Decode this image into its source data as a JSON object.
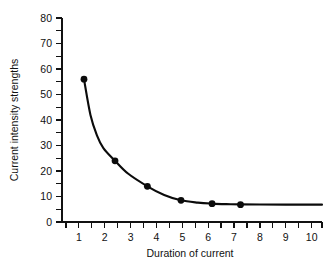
{
  "chart_data": {
    "type": "line",
    "title": "",
    "xlabel": "Duration of current",
    "ylabel": "Current intensity strengths",
    "xlim": [
      0.35,
      10.4
    ],
    "ylim": [
      0,
      80
    ],
    "grid": false,
    "legend": "none",
    "x_ticks": [
      1,
      2,
      3,
      4,
      5,
      6,
      7,
      8,
      9,
      10
    ],
    "x_tick_labels": [
      "1",
      "2",
      "3",
      "4",
      "5",
      "6",
      "7",
      "8",
      "9",
      "10"
    ],
    "x_minor_ticks": [
      0.5,
      1.5,
      2.5,
      3.5,
      4.5,
      5.5,
      6.5,
      7.5,
      8.5,
      9.5,
      10.4
    ],
    "y_ticks": [
      0,
      10,
      20,
      30,
      40,
      50,
      60,
      70,
      80
    ],
    "y_tick_labels": [
      "0",
      "10",
      "20",
      "30",
      "40",
      "50",
      "60",
      "70",
      "80"
    ],
    "y_minor_ticks": [
      5,
      15,
      25,
      35,
      45,
      55,
      65,
      75
    ],
    "series": [
      {
        "name": "Current intensity strengths",
        "marker": "filled-circle",
        "x": [
          1.2,
          2.4,
          3.65,
          4.95,
          6.15,
          7.25
        ],
        "values": [
          56,
          24,
          14,
          8.5,
          7.2,
          6.8
        ]
      }
    ],
    "curve_points": [
      [
        1.2,
        56
      ],
      [
        1.45,
        42
      ],
      [
        1.7,
        34
      ],
      [
        1.95,
        29
      ],
      [
        2.4,
        24
      ],
      [
        2.9,
        19
      ],
      [
        3.65,
        14
      ],
      [
        4.3,
        10.6
      ],
      [
        4.95,
        8.5
      ],
      [
        5.6,
        7.6
      ],
      [
        6.15,
        7.2
      ],
      [
        6.7,
        7.0
      ],
      [
        7.25,
        6.9
      ],
      [
        8.0,
        6.85
      ],
      [
        9.0,
        6.8
      ],
      [
        10.4,
        6.8
      ]
    ],
    "curve_color": "#0b0b0b",
    "axis_color": "#111111",
    "background": "#ffffff"
  }
}
